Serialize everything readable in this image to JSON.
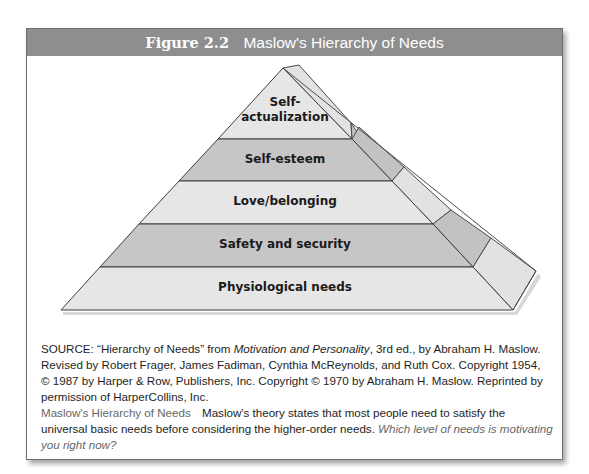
{
  "figure": {
    "number": "Figure 2.2",
    "title": "Maslow's Hierarchy of Needs"
  },
  "pyramid": {
    "levels": [
      {
        "label_line1": "Self-",
        "label_line2": "actualization",
        "shade": "#e6e6e6"
      },
      {
        "label": "Self-esteem",
        "shade": "#c6c6c6"
      },
      {
        "label": "Love/belonging",
        "shade": "#e6e6e6"
      },
      {
        "label": "Safety and security",
        "shade": "#c6c6c6"
      },
      {
        "label": "Physiological needs",
        "shade": "#e6e6e6"
      }
    ],
    "outline_color": "#4a4a4a"
  },
  "source": {
    "prefix": "SOURCE: “Hierarchy of Needs” from ",
    "book": "Motivation and Personality",
    "rest": ", 3rd ed., by Abraham H. Maslow. Revised by Robert Frager, James Fadiman, Cynthia McReynolds, and Ruth Cox. Copyright 1954, © 1987 by Harper & Row, Publishers, Inc. Copyright © 1970 by Abraham H. Maslow. Reprinted by permission of HarperCollins, Inc."
  },
  "caption": {
    "title": "Maslow's Hierarchy of Needs",
    "text": "Maslow's theory states that most people need to satisfy the universal basic needs before considering the higher-order needs. ",
    "question": "Which level of needs is motivating you right now?"
  },
  "colors": {
    "header_bg": "#8e8e8e",
    "light_band": "#e6e6e6",
    "dark_band": "#c6c6c6"
  }
}
